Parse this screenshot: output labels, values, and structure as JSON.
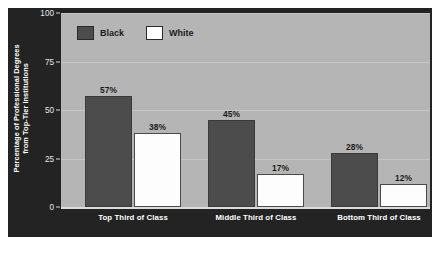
{
  "chart_data": {
    "type": "bar",
    "title": "",
    "subtitle": "",
    "xlabel": "",
    "ylabel_line1": "Percentage of Professional Degrees",
    "ylabel_line2": "from Top-Tier Institutions",
    "categories": [
      "Top Third of Class",
      "Middle Third of Class",
      "Bottom Third of Class"
    ],
    "series": [
      {
        "name": "Black",
        "color": "#4c4c4c",
        "values": [
          57,
          45,
          28
        ],
        "value_labels": [
          "57%",
          "45%",
          "28%"
        ]
      },
      {
        "name": "White",
        "color": "#ffffff",
        "values": [
          38,
          17,
          12
        ],
        "value_labels": [
          "38%",
          "17%",
          "12%"
        ]
      }
    ],
    "ylim": [
      0,
      100
    ],
    "yticks": [
      0,
      25,
      50,
      75,
      100
    ],
    "ytick_labels": [
      "0",
      "25",
      "50",
      "75",
      "100"
    ],
    "grid": true,
    "legend_position": "top-left",
    "panel_background": "#232323",
    "plot_background": "#b5b5b5",
    "gridline_color": "#c6c6c6",
    "axis_text_color": "#ffffff"
  }
}
